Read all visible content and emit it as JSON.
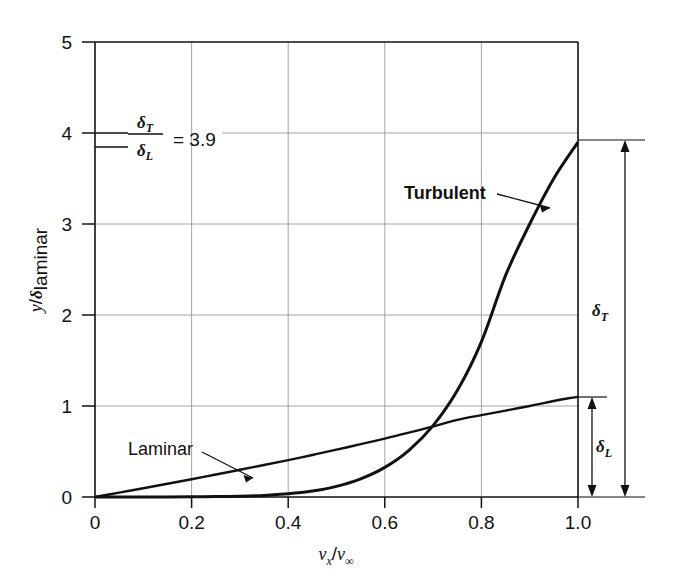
{
  "figure": {
    "background": "#ffffff",
    "ink_color": "#111111",
    "grid_color": "#9a9a9a"
  },
  "axes": {
    "x_title_parts": {
      "v1": "v",
      "sub1": "x",
      "slash": "/",
      "v2": "v",
      "sub2": "∞"
    },
    "x_title": "v_x / v_∞",
    "y_title_parts": {
      "y": "y",
      "slash": "/",
      "delta": "δ",
      "sub": "laminar"
    },
    "y_title": "y/δ_laminar",
    "x_ticks": [
      "0",
      "0.2",
      "0.4",
      "0.6",
      "0.8",
      "1.0"
    ],
    "x_tick_values": [
      0,
      0.2,
      0.4,
      0.6,
      0.8,
      1.0
    ],
    "y_ticks": [
      "0",
      "1",
      "2",
      "3",
      "4",
      "5"
    ],
    "y_tick_values": [
      0,
      1,
      2,
      3,
      4,
      5
    ],
    "xlim": [
      0,
      1.0
    ],
    "ylim": [
      0,
      5
    ],
    "grid": true
  },
  "annotations": {
    "ratio": {
      "numerator_sym": "δ",
      "numerator_sub": "T",
      "denominator_sym": "δ",
      "denominator_sub": "L",
      "equals_value": "= 3.9",
      "text": "δ_T/δ_L = 3.9"
    },
    "turbulent_label": "Turbulent",
    "laminar_label": "Laminar",
    "delta_T": {
      "sym": "δ",
      "sub": "T",
      "text": "δ_T",
      "value": 3.9
    },
    "delta_L": {
      "sym": "δ",
      "sub": "L",
      "text": "δ_L",
      "value": 1.1
    }
  },
  "chart_data": {
    "type": "line",
    "title": "",
    "xlabel": "v_x / v_∞",
    "ylabel": "y/δ_laminar",
    "xlim": [
      0,
      1.0
    ],
    "ylim": [
      0,
      5
    ],
    "grid": true,
    "legend": "inline-annotations",
    "series": [
      {
        "name": "Laminar",
        "comment": "Blasius-type profile, y reaches 1.1 at v_x/v_inf = 1.0",
        "x": [
          0.0,
          0.05,
          0.1,
          0.15,
          0.2,
          0.25,
          0.3,
          0.35,
          0.4,
          0.45,
          0.5,
          0.55,
          0.6,
          0.65,
          0.7,
          0.75,
          0.8,
          0.85,
          0.9,
          0.95,
          0.98,
          1.0
        ],
        "y": [
          0.0,
          0.048,
          0.097,
          0.146,
          0.196,
          0.247,
          0.299,
          0.352,
          0.406,
          0.462,
          0.52,
          0.58,
          0.642,
          0.707,
          0.776,
          0.848,
          0.9,
          0.95,
          1.0,
          1.055,
          1.085,
          1.1
        ]
      },
      {
        "name": "Turbulent",
        "comment": "1/7-power-law profile, y reaches 3.9 at v_x/v_inf = 1.0",
        "x": [
          0.0,
          0.05,
          0.1,
          0.15,
          0.2,
          0.25,
          0.3,
          0.35,
          0.4,
          0.45,
          0.5,
          0.55,
          0.6,
          0.65,
          0.7,
          0.75,
          0.8,
          0.85,
          0.9,
          0.95,
          1.0
        ],
        "y": [
          0.0,
          0.0,
          0.0,
          0.001,
          0.002,
          0.004,
          0.009,
          0.018,
          0.035,
          0.065,
          0.116,
          0.199,
          0.325,
          0.512,
          0.785,
          1.17,
          1.705,
          2.435,
          3.0,
          3.5,
          3.9
        ]
      }
    ],
    "crossing_point": {
      "x": 0.73,
      "y": 0.72
    },
    "annotations": [
      {
        "text": "δ_T/δ_L = 3.9",
        "x": 0.18,
        "y": 3.95
      },
      {
        "text": "Turbulent",
        "x": 0.67,
        "y": 3.38
      },
      {
        "text": "Laminar",
        "x": 0.12,
        "y": 0.72
      }
    ]
  }
}
